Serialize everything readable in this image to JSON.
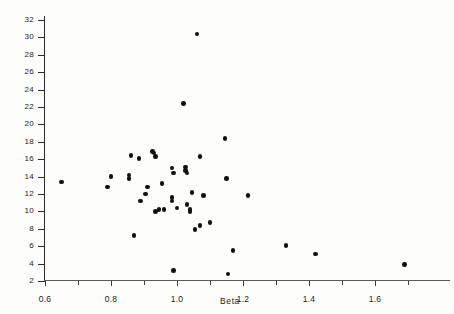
{
  "chart_data": {
    "type": "scatter",
    "title": "",
    "xlabel": "Beta",
    "ylabel": "Expected Return (%)",
    "xlim": [
      0.6,
      1.72
    ],
    "ylim": [
      2,
      32
    ],
    "grid": false,
    "legend": null,
    "xticks": [
      0.6,
      0.8,
      1.0,
      1.2,
      1.4,
      1.6
    ],
    "xtick_labels": [
      "0.6",
      "0.8",
      "1.0",
      "1.2",
      "1.4",
      "1.6"
    ],
    "xminor_ticks": [
      0.7,
      0.9,
      1.1,
      1.3,
      1.5,
      1.7
    ],
    "yticks": [
      2,
      4,
      6,
      8,
      10,
      12,
      14,
      16,
      18,
      20,
      22,
      24,
      26,
      28,
      30,
      32
    ],
    "ytick_labels": [
      "2",
      "4",
      "6",
      "8",
      "10",
      "12",
      "14",
      "16",
      "18",
      "20",
      "22",
      "24",
      "26",
      "28",
      "30",
      "32"
    ],
    "marker": "filled-circle",
    "marker_color": "#111111",
    "points": [
      {
        "x": 0.65,
        "y": 13.4
      },
      {
        "x": 0.79,
        "y": 12.8
      },
      {
        "x": 0.8,
        "y": 14.0
      },
      {
        "x": 0.855,
        "y": 14.2
      },
      {
        "x": 0.855,
        "y": 13.8
      },
      {
        "x": 0.86,
        "y": 16.4
      },
      {
        "x": 0.87,
        "y": 7.2
      },
      {
        "x": 0.885,
        "y": 16.1
      },
      {
        "x": 0.89,
        "y": 11.2
      },
      {
        "x": 0.905,
        "y": 12.0
      },
      {
        "x": 0.91,
        "y": 12.8
      },
      {
        "x": 0.925,
        "y": 16.9
      },
      {
        "x": 0.93,
        "y": 16.7
      },
      {
        "x": 0.935,
        "y": 16.3
      },
      {
        "x": 0.935,
        "y": 10.0
      },
      {
        "x": 0.945,
        "y": 10.2
      },
      {
        "x": 0.955,
        "y": 13.2
      },
      {
        "x": 0.96,
        "y": 10.2
      },
      {
        "x": 0.985,
        "y": 15.0
      },
      {
        "x": 0.985,
        "y": 11.6
      },
      {
        "x": 0.985,
        "y": 11.2
      },
      {
        "x": 0.99,
        "y": 14.4
      },
      {
        "x": 0.99,
        "y": 3.2
      },
      {
        "x": 1.0,
        "y": 10.4
      },
      {
        "x": 1.02,
        "y": 22.4
      },
      {
        "x": 1.025,
        "y": 15.1
      },
      {
        "x": 1.025,
        "y": 14.7
      },
      {
        "x": 1.03,
        "y": 14.4
      },
      {
        "x": 1.03,
        "y": 10.8
      },
      {
        "x": 1.04,
        "y": 10.2
      },
      {
        "x": 1.04,
        "y": 10.0
      },
      {
        "x": 1.045,
        "y": 12.2
      },
      {
        "x": 1.055,
        "y": 7.9
      },
      {
        "x": 1.06,
        "y": 30.4
      },
      {
        "x": 1.07,
        "y": 16.3
      },
      {
        "x": 1.07,
        "y": 8.4
      },
      {
        "x": 1.08,
        "y": 11.8
      },
      {
        "x": 1.1,
        "y": 8.7
      },
      {
        "x": 1.145,
        "y": 18.4
      },
      {
        "x": 1.15,
        "y": 13.8
      },
      {
        "x": 1.155,
        "y": 2.8
      },
      {
        "x": 1.17,
        "y": 5.5
      },
      {
        "x": 1.215,
        "y": 11.8
      },
      {
        "x": 1.33,
        "y": 6.1
      },
      {
        "x": 1.42,
        "y": 5.1
      },
      {
        "x": 1.69,
        "y": 3.9
      }
    ]
  }
}
